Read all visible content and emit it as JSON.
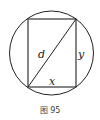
{
  "figure": {
    "caption": "图 95",
    "labels": {
      "diagonal": "d",
      "height": "y",
      "width": "x"
    },
    "stroke_color": "#222222"
  }
}
